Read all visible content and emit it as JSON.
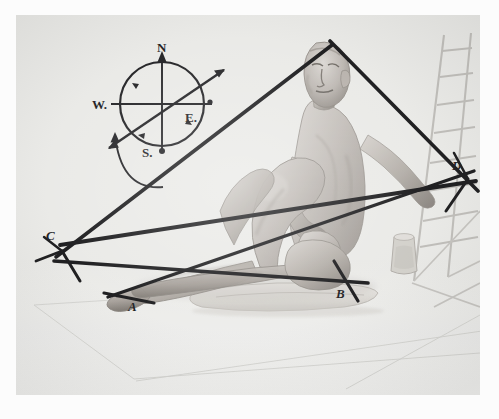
{
  "plate": {
    "title": "Seated male figure study with geometric construction lines",
    "medium": "halftone photographic plate",
    "border_color": "#fdfdfd",
    "ink_color": "#141416",
    "paper_color": "#e9e9e7"
  },
  "construction": {
    "description": "Heavy black straight lines drawn over the figure forming a large triangle with labelled vertices",
    "line_color": "#141416",
    "vertices": [
      {
        "id": "A",
        "label": "A",
        "x": 128,
        "y": 305
      },
      {
        "id": "B",
        "label": "B",
        "x": 333,
        "y": 289
      },
      {
        "id": "C",
        "label": "C",
        "x": 48,
        "y": 234
      },
      {
        "id": "D",
        "label": "D",
        "x": 452,
        "y": 163
      }
    ],
    "apex": {
      "label": "",
      "x": 330,
      "y": 37
    }
  },
  "compass": {
    "name": "compass-rose",
    "center": {
      "x": 146,
      "y": 89
    },
    "radius": 42,
    "north": "N",
    "south": "S.",
    "east": "E.",
    "west": "W.",
    "bearing_arrow": "diagonal NE-SW bearing line with arrowheads",
    "curved_arrow": "curved arrow sweeping from lower right up to the compass"
  },
  "figure": {
    "pose": "seated on a mat, leaning back, left knee raised, arms resting on knee",
    "props": [
      {
        "name": "mat",
        "label": "floor mat / cushion"
      },
      {
        "name": "ladder",
        "label": "wooden ladder / easel frame"
      },
      {
        "name": "jar",
        "label": "small jar"
      }
    ]
  }
}
